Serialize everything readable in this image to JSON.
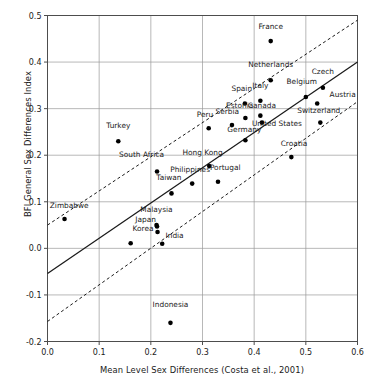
{
  "chart_data": {
    "type": "scatter",
    "title": "",
    "xlabel": "Mean Level Sex Differences (Costa et al., 2001)",
    "ylabel": "BFI General Sex Differences Index",
    "xlim": [
      0.0,
      0.6
    ],
    "ylim": [
      -0.2,
      0.5
    ],
    "xticks": [
      "0.0",
      "0.1",
      "0.2",
      "0.3",
      "0.4",
      "0.5",
      "0.6"
    ],
    "xtick_values": [
      0.0,
      0.1,
      0.2,
      0.3,
      0.4,
      0.5,
      0.6
    ],
    "yticks": [
      "0.5",
      "0.4",
      "0.3",
      "0.2",
      "0.1",
      "0.0",
      "-0.1",
      "-0.2"
    ],
    "ytick_values": [
      0.5,
      0.4,
      0.3,
      0.2,
      0.1,
      0.0,
      -0.1,
      -0.2
    ],
    "grid": true,
    "legend": "none",
    "points": [
      {
        "label": "France",
        "x": 0.432,
        "y": 0.445,
        "lx": 0.432,
        "ly": 0.472,
        "anchor": "middle"
      },
      {
        "label": "Netherlands",
        "x": 0.432,
        "y": 0.361,
        "lx": 0.432,
        "ly": 0.39,
        "anchor": "middle"
      },
      {
        "label": "Czech",
        "x": 0.533,
        "y": 0.345,
        "lx": 0.533,
        "ly": 0.374,
        "anchor": "middle"
      },
      {
        "label": "Belgium",
        "x": 0.5,
        "y": 0.325,
        "lx": 0.492,
        "ly": 0.352,
        "anchor": "middle"
      },
      {
        "label": "Austria",
        "x": 0.522,
        "y": 0.311,
        "lx": 0.546,
        "ly": 0.325,
        "anchor": "start"
      },
      {
        "label": "Italy",
        "x": 0.412,
        "y": 0.317,
        "lx": 0.412,
        "ly": 0.344,
        "anchor": "middle"
      },
      {
        "label": "Spain",
        "x": 0.382,
        "y": 0.311,
        "lx": 0.376,
        "ly": 0.338,
        "anchor": "middle"
      },
      {
        "label": "Canada",
        "x": 0.412,
        "y": 0.285,
        "lx": 0.415,
        "ly": 0.302,
        "anchor": "middle"
      },
      {
        "label": "Estonia",
        "x": 0.383,
        "y": 0.28,
        "lx": 0.372,
        "ly": 0.302,
        "anchor": "middle"
      },
      {
        "label": "Switzerland",
        "x": 0.528,
        "y": 0.27,
        "lx": 0.525,
        "ly": 0.29,
        "anchor": "middle"
      },
      {
        "label": "United States",
        "x": 0.415,
        "y": 0.27,
        "lx": 0.444,
        "ly": 0.263,
        "anchor": "middle"
      },
      {
        "label": "Serbia",
        "x": 0.357,
        "y": 0.265,
        "lx": 0.348,
        "ly": 0.288,
        "anchor": "middle"
      },
      {
        "label": "Peru",
        "x": 0.312,
        "y": 0.258,
        "lx": 0.305,
        "ly": 0.281,
        "anchor": "middle"
      },
      {
        "label": "Germany",
        "x": 0.383,
        "y": 0.232,
        "lx": 0.381,
        "ly": 0.25,
        "anchor": "middle"
      },
      {
        "label": "Turkey",
        "x": 0.137,
        "y": 0.23,
        "lx": 0.137,
        "ly": 0.258,
        "anchor": "middle"
      },
      {
        "label": "Croatia",
        "x": 0.472,
        "y": 0.196,
        "lx": 0.477,
        "ly": 0.219,
        "anchor": "middle"
      },
      {
        "label": "Hong Kong",
        "x": 0.313,
        "y": 0.177,
        "lx": 0.3,
        "ly": 0.2,
        "anchor": "middle"
      },
      {
        "label": "South Africa",
        "x": 0.212,
        "y": 0.165,
        "lx": 0.182,
        "ly": 0.196,
        "anchor": "middle"
      },
      {
        "label": "Portugal",
        "x": 0.33,
        "y": 0.143,
        "lx": 0.344,
        "ly": 0.168,
        "anchor": "middle"
      },
      {
        "label": "Philippines",
        "x": 0.28,
        "y": 0.139,
        "lx": 0.276,
        "ly": 0.164,
        "anchor": "middle"
      },
      {
        "label": "Taiwan",
        "x": 0.24,
        "y": 0.118,
        "lx": 0.235,
        "ly": 0.146,
        "anchor": "middle"
      },
      {
        "label": "Zimbabwe",
        "x": 0.033,
        "y": 0.063,
        "lx": 0.042,
        "ly": 0.086,
        "anchor": "middle"
      },
      {
        "label": "Malaysia",
        "x": 0.211,
        "y": 0.05,
        "lx": 0.211,
        "ly": 0.078,
        "anchor": "middle"
      },
      {
        "label": "Japan",
        "x": 0.212,
        "y": 0.047,
        "lx": 0.19,
        "ly": 0.056,
        "anchor": "middle"
      },
      {
        "label": "Korea",
        "x": 0.213,
        "y": 0.035,
        "lx": 0.185,
        "ly": 0.038,
        "anchor": "middle"
      },
      {
        "label": "India",
        "x": 0.222,
        "y": 0.01,
        "lx": 0.246,
        "ly": 0.022,
        "anchor": "middle"
      },
      {
        "label": "Indonesia",
        "x": 0.238,
        "y": -0.16,
        "lx": 0.238,
        "ly": -0.126,
        "anchor": "middle"
      },
      {
        "label": "",
        "x": 0.161,
        "y": 0.011,
        "lx": 0.161,
        "ly": 0.011,
        "anchor": "middle"
      }
    ],
    "fit_line": {
      "x0": 0.0,
      "y0": -0.054,
      "x1": 0.6,
      "y1": 0.4
    },
    "ci_upper": {
      "x0": 0.0,
      "y0": 0.05,
      "x1": 0.6,
      "y1": 0.49
    },
    "ci_lower": {
      "x0": 0.0,
      "y0": -0.157,
      "x1": 0.6,
      "y1": 0.315
    }
  }
}
